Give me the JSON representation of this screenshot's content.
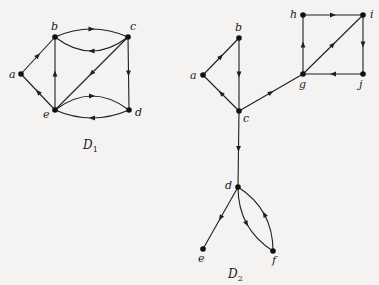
{
  "colors": {
    "background": "#f4f3f1",
    "ink": "#1e1e1e"
  },
  "digraphs": [
    {
      "id": "D1",
      "caption": {
        "main": "D",
        "sub": "1",
        "x": 83,
        "y": 149
      },
      "nodes": [
        {
          "id": "a",
          "label": "a",
          "x": 21,
          "y": 74,
          "lx": 9,
          "ly": 78
        },
        {
          "id": "b",
          "label": "b",
          "x": 55,
          "y": 37,
          "lx": 51,
          "ly": 30
        },
        {
          "id": "c",
          "label": "c",
          "x": 128,
          "y": 37,
          "lx": 130,
          "ly": 30
        },
        {
          "id": "d",
          "label": "d",
          "x": 129,
          "y": 110,
          "lx": 135,
          "ly": 116
        },
        {
          "id": "e",
          "label": "e",
          "x": 55,
          "y": 110,
          "lx": 43,
          "ly": 118
        }
      ],
      "edges": [
        {
          "from": "a",
          "to": "b",
          "curve": 0
        },
        {
          "from": "e",
          "to": "a",
          "curve": 0
        },
        {
          "from": "e",
          "to": "b",
          "curve": 0
        },
        {
          "from": "c",
          "to": "b",
          "curve": -14
        },
        {
          "from": "b",
          "to": "c",
          "curve": -8
        },
        {
          "from": "c",
          "to": "e",
          "curve": 0
        },
        {
          "from": "c",
          "to": "d",
          "curve": 0
        },
        {
          "from": "d",
          "to": "e",
          "curve": -8
        },
        {
          "from": "e",
          "to": "d",
          "curve": -14
        }
      ]
    },
    {
      "id": "D2",
      "caption": {
        "main": "D",
        "sub": "2",
        "x": 228,
        "y": 278
      },
      "nodes": [
        {
          "id": "a",
          "label": "a",
          "x": 203,
          "y": 75,
          "lx": 190,
          "ly": 79
        },
        {
          "id": "b",
          "label": "b",
          "x": 239,
          "y": 38,
          "lx": 235,
          "ly": 31
        },
        {
          "id": "c",
          "label": "c",
          "x": 239,
          "y": 111,
          "lx": 243,
          "ly": 122
        },
        {
          "id": "d",
          "label": "d",
          "x": 238,
          "y": 187,
          "lx": 225,
          "ly": 189
        },
        {
          "id": "e",
          "label": "e",
          "x": 203,
          "y": 249,
          "lx": 198,
          "ly": 262
        },
        {
          "id": "f",
          "label": "f",
          "x": 273,
          "y": 251,
          "lx": 272,
          "ly": 264
        },
        {
          "id": "g",
          "label": "g",
          "x": 303,
          "y": 74,
          "lx": 299,
          "ly": 88
        },
        {
          "id": "h",
          "label": "h",
          "x": 303,
          "y": 15,
          "lx": 290,
          "ly": 18
        },
        {
          "id": "i",
          "label": "i",
          "x": 363,
          "y": 15,
          "lx": 370,
          "ly": 18
        },
        {
          "id": "j",
          "label": "j",
          "x": 363,
          "y": 74,
          "lx": 359,
          "ly": 88
        }
      ],
      "edges": [
        {
          "from": "a",
          "to": "b",
          "curve": 0
        },
        {
          "from": "b",
          "to": "c",
          "curve": 0
        },
        {
          "from": "c",
          "to": "a",
          "curve": 0
        },
        {
          "from": "c",
          "to": "g",
          "curve": 0
        },
        {
          "from": "g",
          "to": "h",
          "curve": 0
        },
        {
          "from": "h",
          "to": "i",
          "curve": 0
        },
        {
          "from": "g",
          "to": "i",
          "curve": 0
        },
        {
          "from": "i",
          "to": "j",
          "curve": 0
        },
        {
          "from": "j",
          "to": "g",
          "curve": 0
        },
        {
          "from": "c",
          "to": "d",
          "curve": 0
        },
        {
          "from": "d",
          "to": "e",
          "curve": 0
        },
        {
          "from": "d",
          "to": "f",
          "curve": 10
        },
        {
          "from": "f",
          "to": "d",
          "curve": 10
        }
      ]
    }
  ]
}
